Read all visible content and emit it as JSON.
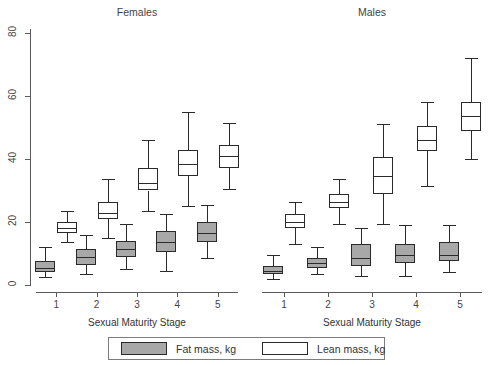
{
  "chart_data": {
    "type": "box",
    "title": "",
    "xlabel": "Sexual Maturity Stage",
    "ylabel": "",
    "ylim": [
      0,
      80
    ],
    "yticks": [
      0,
      20,
      40,
      60,
      80
    ],
    "grid": false,
    "legend_position": "bottom",
    "legend": [
      "Fat mass, kg",
      "Lean mass, kg"
    ],
    "panels": [
      {
        "name": "Females",
        "categories": [
          "1",
          "2",
          "3",
          "4",
          "5"
        ],
        "series": [
          {
            "name": "Fat mass, kg",
            "color": "#a8a8a8",
            "boxes": [
              {
                "stage": "1",
                "min": 2.5,
                "q1": 4.0,
                "median": 5.5,
                "q3": 7.5,
                "max": 12.0
              },
              {
                "stage": "2",
                "min": 3.5,
                "q1": 6.5,
                "median": 9.0,
                "q3": 11.5,
                "max": 16.0
              },
              {
                "stage": "3",
                "min": 5.0,
                "q1": 9.0,
                "median": 11.5,
                "q3": 14.0,
                "max": 19.5
              },
              {
                "stage": "4",
                "min": 4.5,
                "q1": 10.5,
                "median": 13.5,
                "q3": 17.0,
                "max": 22.5
              },
              {
                "stage": "5",
                "min": 8.5,
                "q1": 13.5,
                "median": 16.5,
                "q3": 20.0,
                "max": 25.5
              }
            ]
          },
          {
            "name": "Lean mass, kg",
            "color": "#ffffff",
            "boxes": [
              {
                "stage": "1",
                "min": 13.5,
                "q1": 16.5,
                "median": 18.0,
                "q3": 20.0,
                "max": 23.5
              },
              {
                "stage": "2",
                "min": 15.0,
                "q1": 21.0,
                "median": 23.0,
                "q3": 26.5,
                "max": 33.5
              },
              {
                "stage": "3",
                "min": 23.5,
                "q1": 30.0,
                "median": 32.5,
                "q3": 37.0,
                "max": 46.0
              },
              {
                "stage": "4",
                "min": 25.0,
                "q1": 34.5,
                "median": 38.5,
                "q3": 43.0,
                "max": 55.0
              },
              {
                "stage": "5",
                "min": 30.5,
                "q1": 37.0,
                "median": 41.0,
                "q3": 44.5,
                "max": 51.5
              }
            ]
          }
        ]
      },
      {
        "name": "Males",
        "categories": [
          "1",
          "2",
          "3",
          "4",
          "5"
        ],
        "series": [
          {
            "name": "Fat mass, kg",
            "color": "#a8a8a8",
            "boxes": [
              {
                "stage": "1",
                "min": 2.0,
                "q1": 3.5,
                "median": 4.5,
                "q3": 6.0,
                "max": 9.5
              },
              {
                "stage": "2",
                "min": 3.5,
                "q1": 5.5,
                "median": 7.0,
                "q3": 8.5,
                "max": 12.0
              },
              {
                "stage": "3",
                "min": 3.0,
                "q1": 6.0,
                "median": 8.5,
                "q3": 13.0,
                "max": 18.0
              },
              {
                "stage": "4",
                "min": 3.0,
                "q1": 7.0,
                "median": 9.5,
                "q3": 13.0,
                "max": 19.0
              },
              {
                "stage": "5",
                "min": 4.0,
                "q1": 7.5,
                "median": 9.5,
                "q3": 13.5,
                "max": 19.0
              }
            ]
          },
          {
            "name": "Lean mass, kg",
            "color": "#ffffff",
            "boxes": [
              {
                "stage": "1",
                "min": 13.0,
                "q1": 18.0,
                "median": 20.0,
                "q3": 22.5,
                "max": 26.5
              },
              {
                "stage": "2",
                "min": 19.5,
                "q1": 24.5,
                "median": 26.5,
                "q3": 29.0,
                "max": 33.5
              },
              {
                "stage": "3",
                "min": 19.5,
                "q1": 29.0,
                "median": 34.5,
                "q3": 40.5,
                "max": 51.0
              },
              {
                "stage": "4",
                "min": 31.5,
                "q1": 42.5,
                "median": 46.0,
                "q3": 50.5,
                "max": 58.0
              },
              {
                "stage": "5",
                "min": 40.0,
                "q1": 49.0,
                "median": 53.5,
                "q3": 58.0,
                "max": 72.0
              }
            ]
          }
        ]
      }
    ]
  }
}
